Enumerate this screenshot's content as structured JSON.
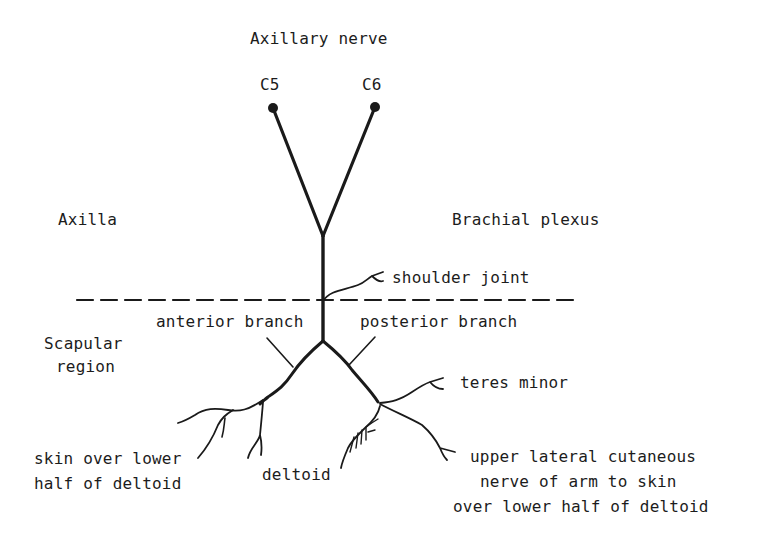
{
  "diagram": {
    "title": "Axillary nerve",
    "roots": [
      {
        "label": "C5"
      },
      {
        "label": "C6"
      }
    ],
    "regions": {
      "upper_left": "Axilla",
      "upper_right": "Brachial plexus",
      "lower_left_line1": "Scapular",
      "lower_left_line2": "region"
    },
    "branches": {
      "shoulder_joint": "shoulder joint",
      "anterior": "anterior branch",
      "posterior": "posterior branch",
      "teres_minor": "teres minor",
      "deltoid": "deltoid",
      "skin_left_line1": "skin over lower",
      "skin_left_line2": "half of deltoid",
      "ulcn_line1": "upper lateral cutaneous",
      "ulcn_line2": "nerve of arm to skin",
      "ulcn_line3": "over lower half of deltoid"
    },
    "colors": {
      "line": "#1a1a1a",
      "background": "#ffffff"
    }
  }
}
